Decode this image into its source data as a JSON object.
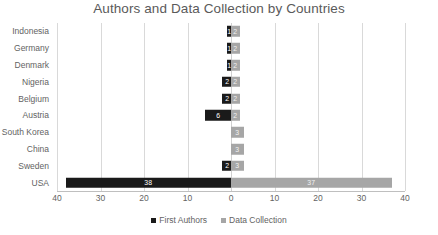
{
  "chart_data": {
    "type": "bar",
    "subtype": "diverging-horizontal-bar",
    "title": "Authors and Data Collection by Countries",
    "xlabel": "",
    "ylabel": "",
    "categories": [
      "Indonesia",
      "Germany",
      "Denmark",
      "Nigeria",
      "Belgium",
      "Austria",
      "South Korea",
      "China",
      "Sweden",
      "USA"
    ],
    "series": [
      {
        "name": "First Authors",
        "direction": "left",
        "color": "#1a1a1a",
        "values": [
          1,
          1,
          1,
          2,
          2,
          6,
          0,
          0,
          2,
          38
        ]
      },
      {
        "name": "Data Collection",
        "direction": "right",
        "color": "#a6a6a6",
        "values": [
          2,
          2,
          2,
          2,
          2,
          2,
          3,
          3,
          3,
          37
        ]
      }
    ],
    "xlim": [
      -40,
      40
    ],
    "x_tick_values": [
      -40,
      -30,
      -20,
      -10,
      0,
      10,
      20,
      30,
      40
    ],
    "x_tick_labels": [
      "40",
      "30",
      "20",
      "10",
      "0",
      "10",
      "20",
      "30",
      "40"
    ],
    "grid": true,
    "grid_axis": "x",
    "legend_position": "bottom",
    "data_labels": true
  },
  "legend": {
    "items": [
      {
        "label": "First Authors",
        "color": "#1a1a1a"
      },
      {
        "label": "Data Collection",
        "color": "#a6a6a6"
      }
    ]
  }
}
